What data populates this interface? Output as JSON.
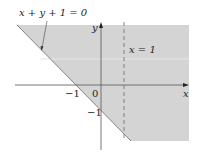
{
  "diagram": {
    "colors": {
      "shade": "#d4d4d4",
      "axis": "#555555",
      "line": "#555555",
      "dashed": "#777777",
      "text": "#222222"
    },
    "labels": {
      "boundary_equation": "x + y + 1 = 0",
      "dashed_equation": "x = 1",
      "x_axis": "x",
      "y_axis": "y",
      "x_tick_neg1": "−1",
      "origin": "0",
      "y_tick_neg1": "−1"
    },
    "lines": [
      {
        "name": "boundary",
        "equation": "x + y + 1 = 0",
        "style": "solid"
      },
      {
        "name": "vertical",
        "equation": "x = 1",
        "style": "dashed"
      }
    ],
    "shaded_region": "x + y + 1 >= 0 (above/right of the line)"
  }
}
